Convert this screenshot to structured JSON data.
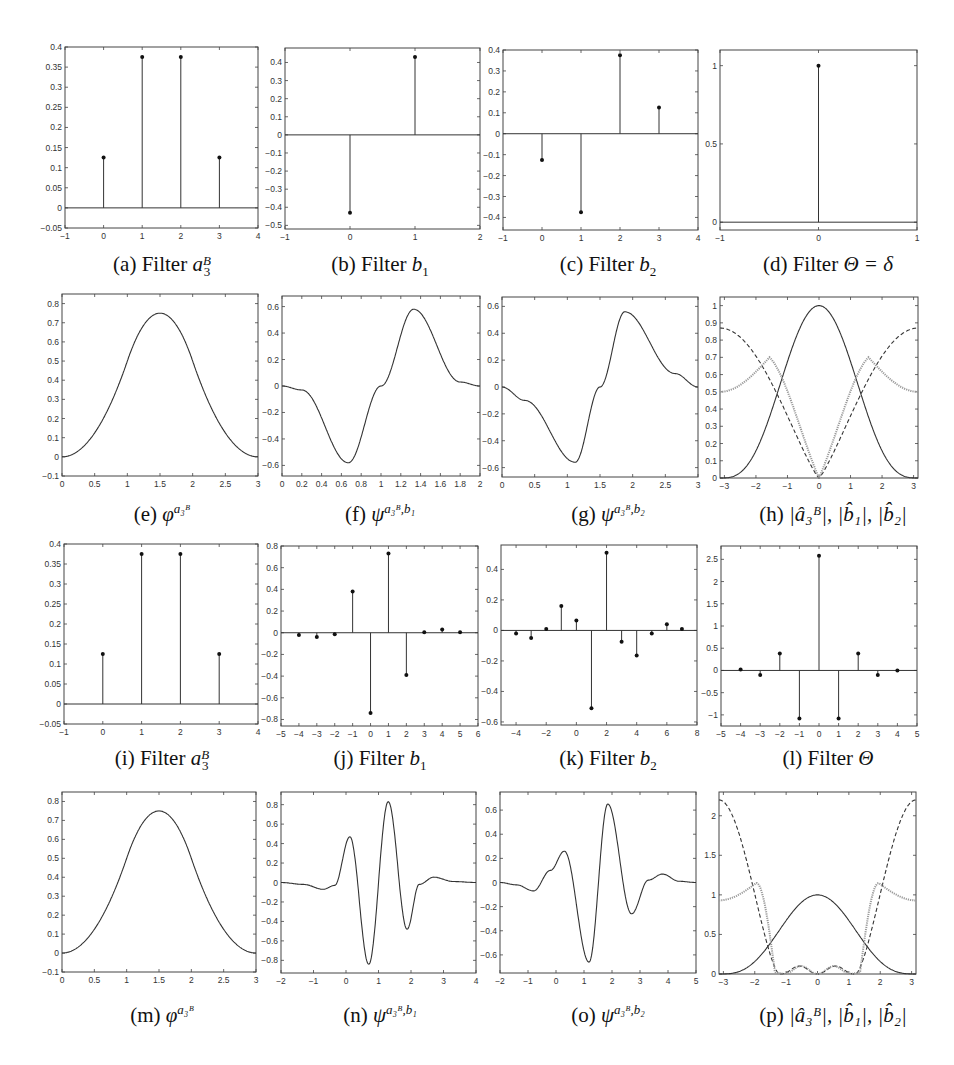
{
  "figure": {
    "captions": {
      "a": {
        "label": "(a)",
        "text": "Filter",
        "math": "a",
        "sup": "B",
        "sub": "3"
      },
      "b": {
        "label": "(b)",
        "text": "Filter",
        "math": "b",
        "sub": "1"
      },
      "c": {
        "label": "(c)",
        "text": "Filter",
        "math": "b",
        "sub": "2"
      },
      "d": {
        "label": "(d)",
        "text": "Filter",
        "math": "Θ = δ"
      },
      "e": {
        "label": "(e)",
        "math": "φ",
        "sup": "a₃ᴮ"
      },
      "f": {
        "label": "(f)",
        "math": "ψ",
        "sup": "a₃ᴮ,b₁"
      },
      "g": {
        "label": "(g)",
        "math": "ψ",
        "sup": "a₃ᴮ,b₂"
      },
      "h": {
        "label": "(h)",
        "math": "|â₃ᴮ|, |b̂₁|, |b̂₂|"
      },
      "i": {
        "label": "(i)",
        "text": "Filter",
        "math": "a",
        "sup": "B",
        "sub": "3"
      },
      "j": {
        "label": "(j)",
        "text": "Filter",
        "math": "b",
        "sub": "1"
      },
      "k": {
        "label": "(k)",
        "text": "Filter",
        "math": "b",
        "sub": "2"
      },
      "l": {
        "label": "(l)",
        "text": "Filter",
        "math": "Θ"
      },
      "m": {
        "label": "(m)",
        "math": "φ",
        "sup": "a₃ᴮ"
      },
      "n": {
        "label": "(n)",
        "math": "ψ",
        "sup": "a₃ᴮ,b₁"
      },
      "o": {
        "label": "(o)",
        "math": "ψ",
        "sup": "a₃ᴮ,b₂"
      },
      "p": {
        "label": "(p)",
        "math": "|â₃ᴮ|, |b̂₁|, |b̂₂|"
      }
    }
  },
  "chart_data": [
    {
      "id": "a",
      "type": "stem",
      "title": "(a) Filter a_3^B",
      "x": [
        0,
        1,
        2,
        3
      ],
      "values": [
        0.125,
        0.375,
        0.375,
        0.125
      ],
      "xlim": [
        -1,
        4
      ],
      "ylim": [
        -0.05,
        0.4
      ],
      "xticks": [
        -1,
        0,
        1,
        2,
        3,
        4
      ],
      "yticks": [
        -0.05,
        0,
        0.05,
        0.1,
        0.15,
        0.2,
        0.25,
        0.3,
        0.35,
        0.4
      ]
    },
    {
      "id": "b",
      "type": "stem",
      "title": "(b) Filter b_1",
      "x": [
        0,
        1
      ],
      "values": [
        -0.43,
        0.43
      ],
      "xlim": [
        -1,
        2
      ],
      "ylim": [
        -0.52,
        0.48
      ],
      "xticks": [
        -1,
        0,
        1,
        2
      ],
      "yticks": [
        -0.5,
        -0.4,
        -0.3,
        -0.2,
        -0.1,
        0,
        0.1,
        0.2,
        0.3,
        0.4
      ]
    },
    {
      "id": "c",
      "type": "stem",
      "title": "(c) Filter b_2",
      "x": [
        0,
        1,
        2,
        3
      ],
      "values": [
        -0.125,
        -0.375,
        0.375,
        0.125
      ],
      "xlim": [
        -1,
        4
      ],
      "ylim": [
        -0.46,
        0.4
      ],
      "xticks": [
        -1,
        0,
        1,
        2,
        3,
        4
      ],
      "yticks": [
        -0.4,
        -0.3,
        -0.2,
        -0.1,
        0,
        0.1,
        0.2,
        0.3,
        0.4
      ]
    },
    {
      "id": "d",
      "type": "stem",
      "title": "(d) Filter Θ = δ",
      "x": [
        0
      ],
      "values": [
        1
      ],
      "xlim": [
        -1,
        1
      ],
      "ylim": [
        -0.05,
        1.1
      ],
      "xticks": [
        -1,
        0,
        1
      ],
      "yticks": [
        0,
        0.5,
        1
      ]
    },
    {
      "id": "e",
      "type": "line",
      "title": "(e) φ^{a_3^B}",
      "xlim": [
        0,
        3
      ],
      "ylim": [
        -0.1,
        0.85
      ],
      "xticks": [
        0,
        0.5,
        1,
        1.5,
        2,
        2.5,
        3
      ],
      "yticks": [
        -0.1,
        0,
        0.1,
        0.2,
        0.3,
        0.4,
        0.5,
        0.6,
        0.7,
        0.8
      ],
      "fn": "bspline3",
      "peak": {
        "x": 1.5,
        "y": 0.75
      }
    },
    {
      "id": "f",
      "type": "line",
      "title": "(f) ψ^{a_3^B,b_1}",
      "xlim": [
        0,
        2
      ],
      "ylim": [
        -0.68,
        0.68
      ],
      "xticks": [
        0,
        0.2,
        0.4,
        0.6,
        0.8,
        1,
        1.2,
        1.4,
        1.6,
        1.8,
        2
      ],
      "yticks": [
        -0.6,
        -0.4,
        -0.2,
        0,
        0.2,
        0.4,
        0.6
      ],
      "fn": "psi_b1_short",
      "min": {
        "x": 0.67,
        "y": -0.58
      },
      "max": {
        "x": 1.33,
        "y": 0.58
      }
    },
    {
      "id": "g",
      "type": "line",
      "title": "(g) ψ^{a_3^B,b_2}",
      "xlim": [
        0,
        3
      ],
      "ylim": [
        -0.67,
        0.67
      ],
      "xticks": [
        0,
        0.5,
        1,
        1.5,
        2,
        2.5,
        3
      ],
      "yticks": [
        -0.6,
        -0.4,
        -0.2,
        0,
        0.2,
        0.4,
        0.6
      ],
      "fn": "psi_b2_short",
      "min": {
        "x": 1.12,
        "y": -0.56
      },
      "max": {
        "x": 1.88,
        "y": 0.56
      }
    },
    {
      "id": "h",
      "type": "line",
      "title": "(h) |â_3^B|, |b̂_1|, |b̂_2|",
      "xlim": [
        -3.14,
        3.14
      ],
      "ylim": [
        0,
        1.05
      ],
      "xticks": [
        -3,
        -2,
        -1,
        0,
        1,
        2,
        3
      ],
      "yticks": [
        0,
        0.1,
        0.2,
        0.3,
        0.4,
        0.5,
        0.6,
        0.7,
        0.8,
        0.9,
        1
      ],
      "series": [
        {
          "name": "|â_3^B|",
          "style": "solid",
          "fn": "cos3"
        },
        {
          "name": "|b̂_1|",
          "style": "dashed",
          "fn": "b1hat"
        },
        {
          "name": "|b̂_2|",
          "style": "dotted",
          "fn": "b2hat"
        }
      ]
    },
    {
      "id": "i",
      "type": "stem",
      "title": "(i) Filter a_3^B",
      "x": [
        0,
        1,
        2,
        3
      ],
      "values": [
        0.125,
        0.375,
        0.375,
        0.125
      ],
      "xlim": [
        -1,
        4
      ],
      "ylim": [
        -0.05,
        0.4
      ],
      "xticks": [
        -1,
        0,
        1,
        2,
        3,
        4
      ],
      "yticks": [
        -0.05,
        0,
        0.05,
        0.1,
        0.15,
        0.2,
        0.25,
        0.3,
        0.35,
        0.4
      ]
    },
    {
      "id": "j",
      "type": "stem",
      "title": "(j) Filter b_1",
      "x": [
        -4,
        -3,
        -2,
        -1,
        0,
        1,
        2,
        3,
        4,
        5
      ],
      "values": [
        -0.02,
        -0.04,
        -0.015,
        0.38,
        -0.74,
        0.73,
        -0.39,
        0.005,
        0.03,
        0.005
      ],
      "xlim": [
        -5,
        6
      ],
      "ylim": [
        -0.86,
        0.8
      ],
      "xticks": [
        -5,
        -4,
        -3,
        -2,
        -1,
        0,
        1,
        2,
        3,
        4,
        5,
        6
      ],
      "yticks": [
        -0.8,
        -0.6,
        -0.4,
        -0.2,
        0,
        0.2,
        0.4,
        0.6,
        0.8
      ]
    },
    {
      "id": "k",
      "type": "stem",
      "title": "(k) Filter b_2",
      "x": [
        -4,
        -3,
        -2,
        -1,
        0,
        1,
        2,
        3,
        4,
        5,
        6,
        7
      ],
      "values": [
        -0.02,
        -0.05,
        0.01,
        0.16,
        0.065,
        -0.51,
        0.51,
        -0.075,
        -0.165,
        -0.02,
        0.04,
        0.01
      ],
      "xlim": [
        -5,
        8
      ],
      "ylim": [
        -0.62,
        0.56
      ],
      "xticks": [
        -4,
        -2,
        0,
        2,
        4,
        6,
        8
      ],
      "yticks": [
        -0.6,
        -0.4,
        -0.2,
        0,
        0.2,
        0.4
      ]
    },
    {
      "id": "l",
      "type": "stem",
      "title": "(l) Filter Θ",
      "x": [
        -4,
        -3,
        -2,
        -1,
        0,
        1,
        2,
        3,
        4
      ],
      "values": [
        0.02,
        -0.1,
        0.38,
        -1.08,
        2.58,
        -1.08,
        0.38,
        -0.1,
        0.0
      ],
      "xlim": [
        -5,
        5
      ],
      "ylim": [
        -1.25,
        2.8
      ],
      "xticks": [
        -5,
        -4,
        -3,
        -2,
        -1,
        0,
        1,
        2,
        3,
        4,
        5
      ],
      "yticks": [
        -1,
        -0.5,
        0,
        0.5,
        1,
        1.5,
        2,
        2.5
      ]
    },
    {
      "id": "m",
      "type": "line",
      "title": "(m) φ^{a_3^B}",
      "xlim": [
        0,
        3
      ],
      "ylim": [
        -0.1,
        0.85
      ],
      "xticks": [
        0,
        0.5,
        1,
        1.5,
        2,
        2.5,
        3
      ],
      "yticks": [
        -0.1,
        0,
        0.1,
        0.2,
        0.3,
        0.4,
        0.5,
        0.6,
        0.7,
        0.8
      ],
      "fn": "bspline3",
      "peak": {
        "x": 1.5,
        "y": 0.75
      }
    },
    {
      "id": "n",
      "type": "line",
      "title": "(n) ψ^{a_3^B,b_1}",
      "xlim": [
        -2,
        4
      ],
      "ylim": [
        -0.93,
        0.93
      ],
      "xticks": [
        -2,
        -1,
        0,
        1,
        2,
        3,
        4
      ],
      "yticks": [
        -0.8,
        -0.6,
        -0.4,
        -0.2,
        0,
        0.2,
        0.4,
        0.6,
        0.8
      ],
      "fn": "psi_b1_long",
      "extrema": [
        {
          "x": -0.7,
          "y": -0.07
        },
        {
          "x": 0.12,
          "y": 0.47
        },
        {
          "x": 0.7,
          "y": -0.84
        },
        {
          "x": 1.3,
          "y": 0.83
        },
        {
          "x": 1.88,
          "y": -0.48
        },
        {
          "x": 2.7,
          "y": 0.05
        }
      ]
    },
    {
      "id": "o",
      "type": "line",
      "title": "(o) ψ^{a_3^B,b_2}",
      "xlim": [
        -2,
        5
      ],
      "ylim": [
        -0.75,
        0.75
      ],
      "xticks": [
        -2,
        -1,
        0,
        1,
        2,
        3,
        4,
        5
      ],
      "yticks": [
        -0.6,
        -0.4,
        -0.2,
        0,
        0.2,
        0.4,
        0.6
      ],
      "fn": "psi_b2_long",
      "extrema": [
        {
          "x": -0.8,
          "y": -0.07
        },
        {
          "x": 0.3,
          "y": 0.26
        },
        {
          "x": 1.18,
          "y": -0.66
        },
        {
          "x": 1.85,
          "y": 0.65
        },
        {
          "x": 2.7,
          "y": -0.26
        },
        {
          "x": 3.8,
          "y": 0.07
        }
      ]
    },
    {
      "id": "p",
      "type": "line",
      "title": "(p) |â_3^B|, |b̂_1|, |b̂_2|",
      "xlim": [
        -3.14,
        3.14
      ],
      "ylim": [
        0,
        2.3
      ],
      "xticks": [
        -3,
        -2,
        -1,
        0,
        1,
        2,
        3
      ],
      "yticks": [
        0,
        0.5,
        1,
        1.5,
        2
      ],
      "series": [
        {
          "name": "|â_3^B|",
          "style": "solid",
          "fn": "cos3"
        },
        {
          "name": "|b̂_1|",
          "style": "dashed",
          "fn": "p_dashed"
        },
        {
          "name": "|b̂_2|",
          "style": "dotted",
          "fn": "p_dotted"
        }
      ]
    }
  ]
}
